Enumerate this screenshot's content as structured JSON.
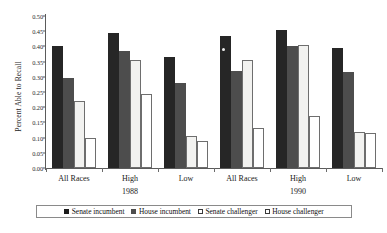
{
  "chart_data": {
    "type": "bar",
    "title": "",
    "xlabel": "",
    "ylabel": "Percent Able to Recall",
    "ylim": [
      0.0,
      0.5
    ],
    "ytick_labels": [
      "0.50",
      "0.45",
      "0.40",
      "0.35",
      "0.30",
      "0.25",
      "0.20",
      "0.15",
      "0.10",
      "0.05",
      "0.00"
    ],
    "ytick_values": [
      0.5,
      0.45,
      0.4,
      0.35,
      0.3,
      0.25,
      0.2,
      0.15,
      0.1,
      0.05,
      0.0
    ],
    "grid": false,
    "legend_position": "bottom",
    "categories": [
      "All Races",
      "High",
      "Low",
      "All Races",
      "High",
      "Low"
    ],
    "era_groups": [
      {
        "label": "1988",
        "categories": [
          "All Races",
          "High",
          "Low"
        ]
      },
      {
        "label": "1990",
        "categories": [
          "All Races",
          "High",
          "Low"
        ]
      }
    ],
    "series": [
      {
        "name": "Senate incumbent",
        "color": "#262626",
        "values": [
          0.4,
          0.445,
          0.365,
          0.435,
          0.455,
          0.395
        ]
      },
      {
        "name": "House incumbent",
        "color": "#4d4d4d",
        "values": [
          0.295,
          0.385,
          0.28,
          0.32,
          0.4,
          0.315
        ]
      },
      {
        "name": "Senate challenger",
        "color": "#f2f2f0",
        "values": [
          0.22,
          0.355,
          0.105,
          0.355,
          0.405,
          0.12
        ]
      },
      {
        "name": "House challenger",
        "color": "#ffffff",
        "values": [
          0.1,
          0.245,
          0.09,
          0.13,
          0.17,
          0.115
        ]
      }
    ]
  },
  "legend": {
    "items": [
      {
        "label": "Senate incumbent"
      },
      {
        "label": "House incumbent"
      },
      {
        "label": "Senate challenger"
      },
      {
        "label": "House challenger"
      }
    ]
  }
}
